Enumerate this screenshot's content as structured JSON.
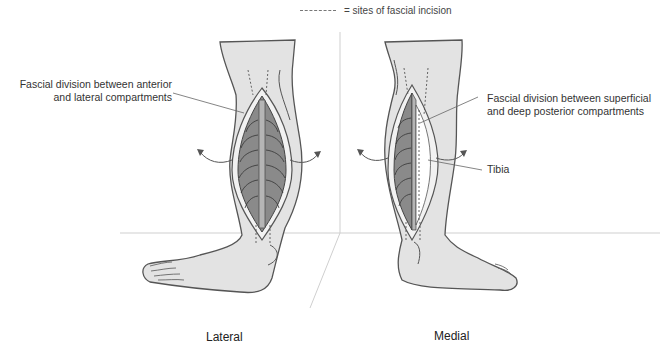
{
  "legend": {
    "symbol": "dotted-line",
    "text": "= sites of fascial incision"
  },
  "views": [
    {
      "caption": "Lateral",
      "labels": [
        {
          "line1": "Fascial division between anterior",
          "line2": "and lateral compartments"
        }
      ]
    },
    {
      "caption": "Medial",
      "labels": [
        {
          "line1": "Fascial division between superficial",
          "line2": "and deep posterior compartments"
        },
        {
          "line1": "Tibia"
        }
      ]
    }
  ],
  "colors": {
    "skin": "#e3e3e3",
    "outline": "#555555",
    "muscle": "#8a8a8a",
    "muscle_dark": "#6e6e6e",
    "fascia": "#f2f2f2",
    "floor_lines": "#cccccc"
  }
}
